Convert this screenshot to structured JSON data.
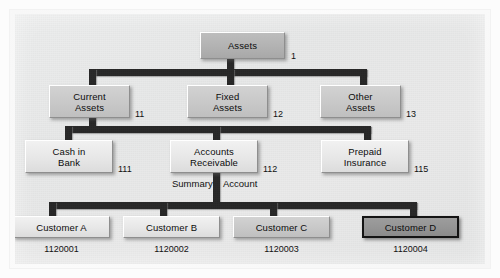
{
  "diagram": {
    "caption_summary": "Summary",
    "caption_account": "Account",
    "levels": [
      {
        "name": "level-1",
        "nodes": [
          {
            "label": "Assets",
            "code": "1",
            "tone": "dark",
            "selected": false
          }
        ]
      },
      {
        "name": "level-2",
        "nodes": [
          {
            "label": "Current\nAssets",
            "line1": "Current",
            "line2": "Assets",
            "code": "11",
            "tone": "mid",
            "selected": false
          },
          {
            "label": "Fixed\nAssets",
            "line1": "Fixed",
            "line2": "Assets",
            "code": "12",
            "tone": "mid",
            "selected": false
          },
          {
            "label": "Other\nAssets",
            "line1": "Other",
            "line2": "Assets",
            "code": "13",
            "tone": "mid",
            "selected": false
          }
        ]
      },
      {
        "name": "level-3",
        "nodes": [
          {
            "line1": "Cash in",
            "line2": "Bank",
            "code": "111",
            "tone": "light",
            "selected": false
          },
          {
            "line1": "Accounts",
            "line2": "Receivable",
            "code": "112",
            "tone": "light",
            "selected": false
          },
          {
            "line1": "Prepaid",
            "line2": "Insurance",
            "code": "115",
            "tone": "light",
            "selected": false
          }
        ]
      },
      {
        "name": "level-4",
        "nodes": [
          {
            "label": "Customer A",
            "code": "1120001",
            "tone": "light",
            "selected": false
          },
          {
            "label": "Customer B",
            "code": "1120002",
            "tone": "light",
            "selected": false
          },
          {
            "label": "Customer C",
            "code": "1120003",
            "tone": "mid",
            "selected": false
          },
          {
            "label": "Customer D",
            "code": "1120004",
            "tone": "selected",
            "selected": true
          }
        ]
      }
    ],
    "colors": {
      "panel_background": "#eaeaea",
      "connector": "#262626",
      "box_dark": "#b2b2b2",
      "box_mid": "#c8c8c8",
      "box_light": "#e7e7e7",
      "box_selected": "#949494",
      "text": "#0c0c0c"
    }
  }
}
